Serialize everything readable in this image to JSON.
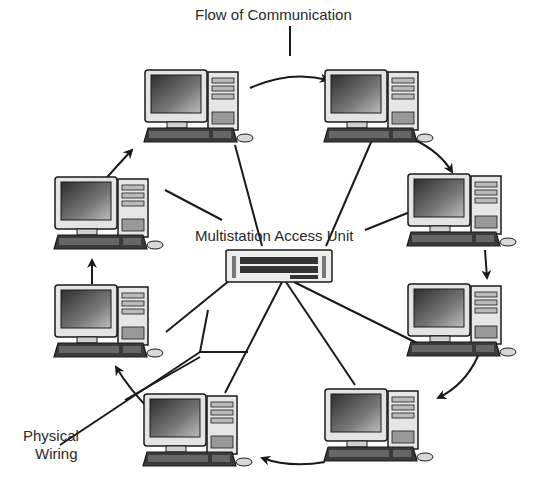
{
  "labels": {
    "flow": "Flow of Communication",
    "mau": "Multistation Access Unit",
    "wiring_line1": "Physical",
    "wiring_line2": "Wiring"
  },
  "nodes": [
    {
      "id": "pc-top-left",
      "x": 145,
      "y": 68
    },
    {
      "id": "pc-top-right",
      "x": 325,
      "y": 68
    },
    {
      "id": "pc-right-upper",
      "x": 408,
      "y": 172
    },
    {
      "id": "pc-right-lower",
      "x": 408,
      "y": 282
    },
    {
      "id": "pc-bottom-right",
      "x": 325,
      "y": 387
    },
    {
      "id": "pc-bottom-left",
      "x": 144,
      "y": 392
    },
    {
      "id": "pc-left-lower",
      "x": 55,
      "y": 283
    },
    {
      "id": "pc-left-upper",
      "x": 55,
      "y": 175
    }
  ],
  "hub": {
    "x": 226,
    "y": 250,
    "w": 106,
    "h": 32
  },
  "colors": {
    "ink": "#1a1a1a",
    "text": "#2a2a2a",
    "screen": "#555555",
    "case": "#e6e6e6"
  }
}
